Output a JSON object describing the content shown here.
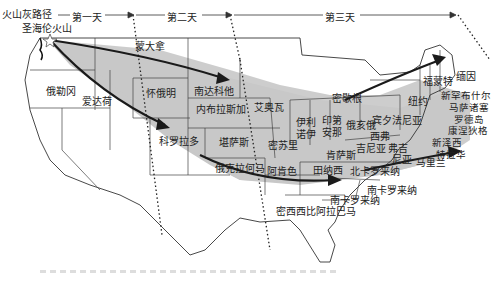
{
  "legend": {
    "title": "火山灰路径",
    "days": [
      "第一天",
      "第二天",
      "第三天"
    ]
  },
  "source": {
    "label": "圣海伦火山",
    "icon": "star-icon"
  },
  "regions": [
    {
      "id": "idaho",
      "label": "爱达荷"
    },
    {
      "id": "oregon",
      "label": "俄勒冈"
    },
    {
      "id": "montana",
      "label": "蒙大拿"
    },
    {
      "id": "wyoming",
      "label": "怀俄明"
    },
    {
      "id": "colorado",
      "label": "科罗拉多"
    },
    {
      "id": "south-dakota",
      "label": "南达科他"
    },
    {
      "id": "nebraska",
      "label": "内布拉斯加"
    },
    {
      "id": "kansas",
      "label": "堪萨斯"
    },
    {
      "id": "oklahoma",
      "label": "俄克拉何马"
    },
    {
      "id": "iowa",
      "label": "艾奥瓦"
    },
    {
      "id": "missouri",
      "label": "密苏里"
    },
    {
      "id": "arkansas",
      "label": "阿肯色"
    },
    {
      "id": "illinois",
      "label_1": "伊利",
      "label_2": "诺伊"
    },
    {
      "id": "indiana",
      "label_1": "印第",
      "label_2": "安那"
    },
    {
      "id": "ohio",
      "label": "俄亥俄"
    },
    {
      "id": "michigan",
      "label": "密歇根"
    },
    {
      "id": "kentucky",
      "label": "肯萨斯"
    },
    {
      "id": "tennessee",
      "label": "田纳西"
    },
    {
      "id": "mississippi-alabama",
      "label": "密西西比阿拉巴马"
    },
    {
      "id": "north-carolina",
      "label": "北卡罗来纳"
    },
    {
      "id": "south-carolina",
      "label": "南卡罗来纳"
    },
    {
      "id": "georgia",
      "label": "南卡罗来纳"
    },
    {
      "id": "pennsylvania",
      "label": "宾夕法尼亚"
    },
    {
      "id": "west-virginia",
      "label_1": "西弗",
      "label_2": "吉尼亚"
    },
    {
      "id": "virginia",
      "label_1": "弗吉",
      "label_2": "尼亚"
    },
    {
      "id": "new-york",
      "label": "纽约"
    },
    {
      "id": "vermont",
      "label": "福蒙特"
    },
    {
      "id": "maine",
      "label": "缅因"
    },
    {
      "id": "new-hampshire",
      "label": "新罕布什尔"
    },
    {
      "id": "massachusetts",
      "label": "马萨诸塞"
    },
    {
      "id": "rhode-island",
      "label": "罗德岛"
    },
    {
      "id": "connecticut",
      "label": "康涅狄格"
    },
    {
      "id": "new-jersey",
      "label": "新泽西"
    },
    {
      "id": "delaware",
      "label": "特拉华"
    },
    {
      "id": "maryland",
      "label": "马里兰"
    }
  ],
  "colors": {
    "ash_band": "#c8c8c8",
    "state_border": "#444444",
    "arrow": "#222222",
    "background": "#ffffff"
  }
}
